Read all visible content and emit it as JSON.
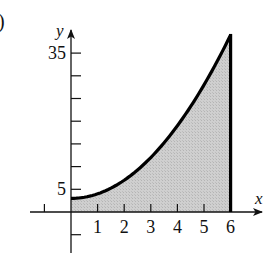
{
  "figure": {
    "part_label": ")"
  },
  "chart_data": {
    "type": "area",
    "title": "",
    "xlabel": "x",
    "ylabel": "y",
    "function": "y = x^2 + 3",
    "shaded_region": {
      "x_from": 0,
      "x_to": 6,
      "description": "area under curve from x=0 to x=6"
    },
    "x": [
      0,
      0.5,
      1,
      1.5,
      2,
      2.5,
      3,
      3.5,
      4,
      4.5,
      5,
      5.5,
      6
    ],
    "y": [
      3,
      3.25,
      4,
      5.25,
      7,
      9.25,
      12,
      15.25,
      19,
      23.25,
      28,
      33.25,
      39
    ],
    "x_ticks": [
      -1,
      1,
      2,
      3,
      4,
      5,
      6
    ],
    "x_tick_labels": [
      "1",
      "2",
      "3",
      "4",
      "5",
      "6"
    ],
    "y_ticks": [
      -5,
      5,
      10,
      15,
      20,
      25,
      30,
      35
    ],
    "y_tick_labels": [
      "5",
      "35"
    ],
    "xlim": [
      -1.5,
      7.2
    ],
    "ylim": [
      -9,
      40
    ],
    "grid": false,
    "legend": null,
    "colors": {
      "curve": "#000000",
      "fill": "#c6c6c6",
      "axes": "#111111"
    }
  }
}
